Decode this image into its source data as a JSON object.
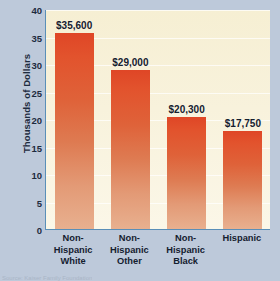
{
  "chart_data": {
    "type": "bar",
    "title": "",
    "xlabel": "",
    "ylabel": "Thousands of Dollars",
    "categories": [
      "Non-Hispanic White",
      "Non-Hispanic Other",
      "Non-Hispanic Black",
      "Hispanic"
    ],
    "category_lines": [
      [
        "Non-",
        "Hispanic",
        "White"
      ],
      [
        "Non-",
        "Hispanic",
        "Other"
      ],
      [
        "Non-",
        "Hispanic",
        "Black"
      ],
      [
        "Hispanic"
      ]
    ],
    "values": [
      35.6,
      29.0,
      20.3,
      17.75
    ],
    "value_labels": [
      "$35,600",
      "$29,000",
      "$20,300",
      "$17,750"
    ],
    "ylim": [
      0,
      40
    ],
    "yticks": [
      0,
      5,
      10,
      15,
      20,
      25,
      30,
      35,
      40
    ],
    "ytick_labels": [
      "0",
      "5",
      "10",
      "15",
      "20",
      "25",
      "30",
      "35",
      "40"
    ],
    "grid": true,
    "legend": "none",
    "bar_color_top": "#df4626",
    "bar_color_bottom": "#e8b08f",
    "plot_background": "#f8f2dc",
    "axis_color": "#5a8fb8",
    "page_background": "#bdc9da",
    "text_color": "#14202f"
  },
  "source_note": "Source: Kaiser Family Foundation"
}
